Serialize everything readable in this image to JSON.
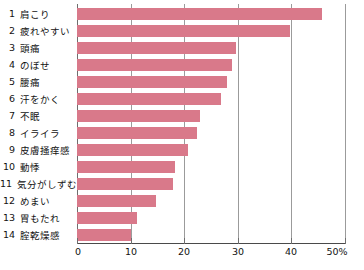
{
  "chart_data": {
    "type": "bar",
    "orientation": "horizontal",
    "title": "",
    "xlabel": "",
    "ylabel": "",
    "xlim": [
      0,
      50
    ],
    "grid": true,
    "legend": false,
    "bar_color": "#d9798a",
    "axis_unit": "%",
    "xticks": [
      {
        "value": 0,
        "label": "0"
      },
      {
        "value": 10,
        "label": "10"
      },
      {
        "value": 20,
        "label": "20"
      },
      {
        "value": 30,
        "label": "30"
      },
      {
        "value": 40,
        "label": "40"
      },
      {
        "value": 50,
        "label": "50%"
      }
    ],
    "categories": [
      "肩こり",
      "疲れやすい",
      "頭痛",
      "のぼせ",
      "腰痛",
      "汗をかく",
      "不眠",
      "イライラ",
      "皮膚掻痒感",
      "動悸",
      "気分がしずむ",
      "めまい",
      "胃もたれ",
      "腟乾燥感"
    ],
    "ranks": [
      "1",
      "2",
      "3",
      "4",
      "5",
      "6",
      "7",
      "8",
      "9",
      "10",
      "11",
      "12",
      "13",
      "14"
    ],
    "values": [
      45.7,
      39.7,
      29.7,
      28.9,
      28.0,
      26.9,
      23.0,
      22.4,
      20.7,
      18.3,
      17.9,
      14.7,
      11.2,
      10.1
    ]
  }
}
